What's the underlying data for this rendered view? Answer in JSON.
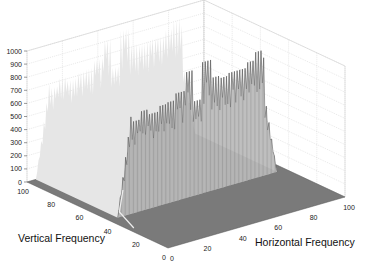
{
  "chart_data": {
    "type": "surface3d",
    "title": "",
    "xlabel": "Horizontal Frequency",
    "ylabel": "Vertical Frequency",
    "zlabel": "",
    "xlim": [
      0,
      100
    ],
    "ylim": [
      0,
      100
    ],
    "zlim": [
      0,
      1000
    ],
    "x_ticks": [
      "0",
      "20",
      "40",
      "60",
      "80",
      "100"
    ],
    "y_ticks": [
      "0",
      "20",
      "40",
      "60",
      "80",
      "100"
    ],
    "z_ticks": [
      "0",
      "100",
      "200",
      "300",
      "400",
      "500",
      "600",
      "700",
      "800",
      "900",
      "1000"
    ],
    "grid": true,
    "ridge": {
      "vertical_frequency_range": [
        38,
        100
      ],
      "horizontal_frequency_range": [
        5,
        95
      ],
      "typical_height": 650,
      "peak_heights": [
        {
          "h": 10,
          "z": 790
        },
        {
          "h": 15,
          "z": 700
        },
        {
          "h": 20,
          "z": 760
        },
        {
          "h": 25,
          "z": 720
        },
        {
          "h": 30,
          "z": 760
        },
        {
          "h": 35,
          "z": 770
        },
        {
          "h": 40,
          "z": 820
        },
        {
          "h": 45,
          "z": 960
        },
        {
          "h": 50,
          "z": 720
        },
        {
          "h": 55,
          "z": 1000
        },
        {
          "h": 60,
          "z": 860
        },
        {
          "h": 65,
          "z": 840
        },
        {
          "h": 70,
          "z": 860
        },
        {
          "h": 75,
          "z": 860
        },
        {
          "h": 80,
          "z": 900
        },
        {
          "h": 85,
          "z": 960
        },
        {
          "h": 90,
          "z": 700
        }
      ]
    }
  },
  "colors": {
    "floor": "#7a7a7a",
    "ridge_fill": "#d8d8d8",
    "ridge_lines": "#6a6a6a",
    "grid": "#d0d0d0"
  }
}
